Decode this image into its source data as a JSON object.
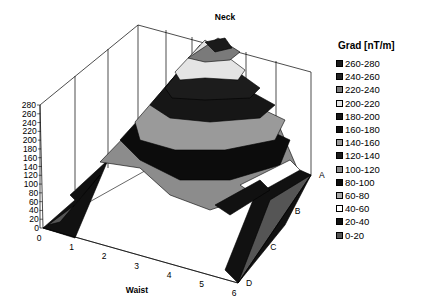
{
  "chart_data": {
    "type": "surface3d",
    "title": "",
    "top_label": "Neck",
    "xlabel": "Waist",
    "ylabel": "",
    "x_ticks": [
      "0",
      "1",
      "2",
      "3",
      "4",
      "5",
      "6"
    ],
    "depth_ticks": [
      "A",
      "B",
      "C",
      "D"
    ],
    "z_ticks": [
      "0",
      "20",
      "40",
      "60",
      "80",
      "100",
      "120",
      "140",
      "160",
      "180",
      "200",
      "220",
      "240",
      "260",
      "280"
    ],
    "zlim": [
      0,
      280
    ],
    "legend_title": "Grad [nT/m]",
    "legend": [
      {
        "label": "260-280",
        "color": "#1a1a1a"
      },
      {
        "label": "240-260",
        "color": "#222222"
      },
      {
        "label": "220-240",
        "color": "#7a7a7a"
      },
      {
        "label": "200-220",
        "color": "#e4e4e4"
      },
      {
        "label": "180-200",
        "color": "#161616"
      },
      {
        "label": "160-180",
        "color": "#101010"
      },
      {
        "label": "140-160",
        "color": "#9a9a9a"
      },
      {
        "label": "120-140",
        "color": "#1c1c1c"
      },
      {
        "label": "100-120",
        "color": "#8c8c8c"
      },
      {
        "label": "80-100",
        "color": "#0c0c0c"
      },
      {
        "label": "60-80",
        "color": "#a8a8a8"
      },
      {
        "label": "40-60",
        "color": "#ffffff"
      },
      {
        "label": "20-40",
        "color": "#111111"
      },
      {
        "label": "0-20",
        "color": "#555555"
      }
    ],
    "surface_description": "Peak near Waist 3-4, depth A (Neck side) reaching ~260-280 nT/m, decreasing toward Waist 0 and depth D (0-60 nT/m)",
    "grid": true,
    "legend_position": "right"
  }
}
